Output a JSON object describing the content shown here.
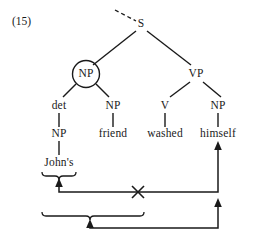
{
  "figure": {
    "example_number": "(15)",
    "sentence": "John's friend washed himself"
  },
  "tree": {
    "nodes": [
      {
        "id": "s",
        "label": "S",
        "x": 141,
        "y": 24,
        "circled": false
      },
      {
        "id": "np-top",
        "label": "NP",
        "x": 86,
        "y": 74,
        "circled": true
      },
      {
        "id": "vp",
        "label": "VP",
        "x": 196,
        "y": 74,
        "circled": false
      },
      {
        "id": "det",
        "label": "det",
        "x": 59,
        "y": 106,
        "circled": false
      },
      {
        "id": "np-friend",
        "label": "NP",
        "x": 113,
        "y": 106,
        "circled": false
      },
      {
        "id": "v",
        "label": "V",
        "x": 165,
        "y": 106,
        "circled": false
      },
      {
        "id": "np-himself",
        "label": "NP",
        "x": 218,
        "y": 106,
        "circled": false
      },
      {
        "id": "np-johns",
        "label": "NP",
        "x": 59,
        "y": 134,
        "circled": false
      },
      {
        "id": "friend",
        "label": "friend",
        "x": 113,
        "y": 134,
        "circled": false
      },
      {
        "id": "washed",
        "label": "washed",
        "x": 165,
        "y": 134,
        "circled": false
      },
      {
        "id": "himself",
        "label": "himself",
        "x": 218,
        "y": 134,
        "circled": false
      },
      {
        "id": "johns",
        "label": "John's",
        "x": 59,
        "y": 163,
        "circled": false
      }
    ]
  },
  "annotations": {
    "blocked_marker": "×",
    "brace_upper_label": "John's",
    "brace_lower_label": "John's friend"
  },
  "colors": {
    "ink": "#1a1a1a",
    "background": "#ffffff"
  }
}
